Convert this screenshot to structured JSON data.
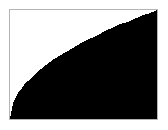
{
  "figure": {
    "name": "filled-area-plot",
    "background_color": "#ffffff",
    "frame_color": "#b4b4b4",
    "fill_color": "#000000",
    "title": "",
    "has_text_labels": false
  },
  "chart_data": {
    "type": "area",
    "title": "",
    "subtitle": "",
    "xlabel": "",
    "ylabel": "",
    "xlim": [
      0,
      1
    ],
    "ylim": [
      0,
      1
    ],
    "grid": false,
    "legend": null,
    "axis_ticks_visible": false,
    "tick_labels": {
      "x": [],
      "y": []
    },
    "annotations": [],
    "fill_direction": "below-curve",
    "fill_color": "#000000",
    "series": [
      {
        "name": "curve",
        "description": "concave-down increasing curve, approximately y = x^0.5",
        "x": [
          0.0,
          0.02,
          0.04,
          0.06,
          0.08,
          0.1,
          0.14,
          0.18,
          0.22,
          0.26,
          0.3,
          0.35,
          0.4,
          0.45,
          0.5,
          0.55,
          0.6,
          0.65,
          0.7,
          0.75,
          0.8,
          0.85,
          0.9,
          0.95,
          1.0
        ],
        "y": [
          0.0,
          0.14,
          0.2,
          0.25,
          0.28,
          0.32,
          0.37,
          0.42,
          0.47,
          0.51,
          0.55,
          0.59,
          0.63,
          0.67,
          0.71,
          0.74,
          0.77,
          0.81,
          0.84,
          0.87,
          0.89,
          0.92,
          0.95,
          0.97,
          1.0
        ]
      }
    ]
  }
}
